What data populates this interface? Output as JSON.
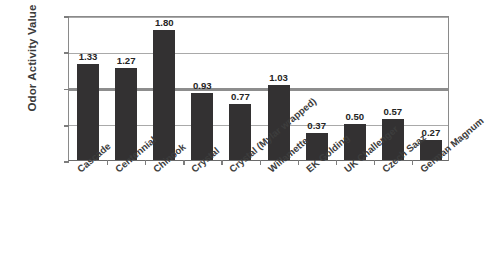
{
  "chart_data": {
    "type": "bar",
    "title": "",
    "xlabel": "",
    "ylabel": "Odor Activity Value",
    "ylim": [
      0,
      2.0
    ],
    "ytick_labels": [
      "0.00",
      "0.50",
      "1.00",
      "1.50",
      "2.00"
    ],
    "ytick_values": [
      0,
      0.5,
      1.0,
      1.5,
      2.0
    ],
    "grid": true,
    "grid_axis": "y",
    "legend": "none",
    "bar_color": "#333132",
    "emphasized_gridline": 1.0,
    "categories": [
      "Cascade",
      "Centennial",
      "Chinook",
      "Crystal",
      "Crystal (Mylar wrapped)",
      "Willamette",
      "EK Golding",
      "UK Challenger",
      "Czech Saaz",
      "German Magnum"
    ],
    "values": [
      1.33,
      1.27,
      1.8,
      0.93,
      0.77,
      1.03,
      0.37,
      0.5,
      0.57,
      0.27
    ],
    "value_labels": [
      "1.33",
      "1.27",
      "1.80",
      "0.93",
      "0.77",
      "1.03",
      "0.37",
      "0.50",
      "0.57",
      "0.27"
    ]
  }
}
